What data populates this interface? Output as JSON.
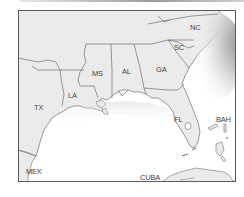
{
  "map": {
    "type": "regional-reference-map",
    "region": "Southeastern United States",
    "colors": {
      "land": "#ebebeb",
      "water": "#ffffff",
      "border": "#6e6e6e",
      "frame": "#5a5a5a",
      "label": "#444444"
    },
    "labels": {
      "nc": "NC",
      "sc": "SC",
      "ga": "GA",
      "al": "AL",
      "ms": "MS",
      "la": "LA",
      "tx": "TX",
      "fl": "FL",
      "bah": "BAH",
      "mex": "MEX",
      "cuba": "CUBA"
    }
  }
}
